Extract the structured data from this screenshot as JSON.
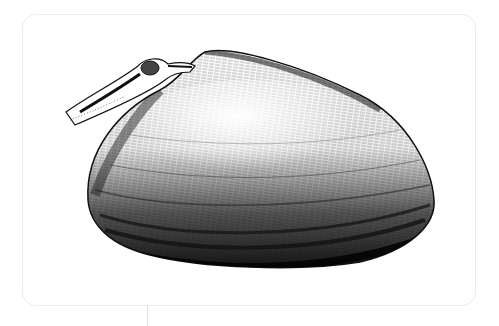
{
  "image": {
    "subject": "Pen-and-ink stipple illustration of a clam shell with extended siphon",
    "alt_text": "Black and white ink drawing of a clam"
  },
  "colors": {
    "background": "#ffffff",
    "card_border": "#ececec",
    "ink": "#111111"
  }
}
